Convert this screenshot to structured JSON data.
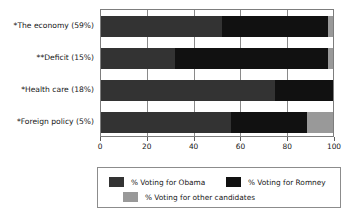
{
  "chart_data": {
    "type": "bar",
    "orientation": "horizontal",
    "stacked": true,
    "title": "",
    "subtitle": "",
    "xlabel": "",
    "ylabel": "",
    "xlim": [
      0,
      100
    ],
    "xticks": [
      0,
      20,
      40,
      60,
      80,
      100
    ],
    "xtick_labels": [
      "0",
      "20",
      "40",
      "60",
      "80",
      "100"
    ],
    "grid": true,
    "grid_axis": "x",
    "legend_position": "bottom",
    "categories": [
      "*The economy (59%)",
      "**Deficit (15%)",
      "*Health care (18%)",
      "*Foreign policy (5%)"
    ],
    "series": [
      {
        "name": "% Voting for Obama",
        "color": "#333333",
        "values": [
          52,
          32,
          75,
          56
        ]
      },
      {
        "name": "% Voting for Romney",
        "color": "#111111",
        "values": [
          46,
          66,
          25,
          33
        ]
      },
      {
        "name": "% Voting for other candidates",
        "color": "#999999",
        "values": [
          2,
          2,
          0,
          11
        ]
      }
    ]
  },
  "legend": {
    "items": [
      {
        "label": "% Voting for Obama",
        "color": "#333333"
      },
      {
        "label": "% Voting for Romney",
        "color": "#111111"
      },
      {
        "label": "% Voting for other candidates",
        "color": "#999999"
      }
    ]
  },
  "colors": {
    "obama": "#333333",
    "romney": "#111111",
    "other": "#999999",
    "axis": "#7d7d7d",
    "grid": "#8a8a8a",
    "text": "#161616",
    "background": "#ffffff"
  }
}
